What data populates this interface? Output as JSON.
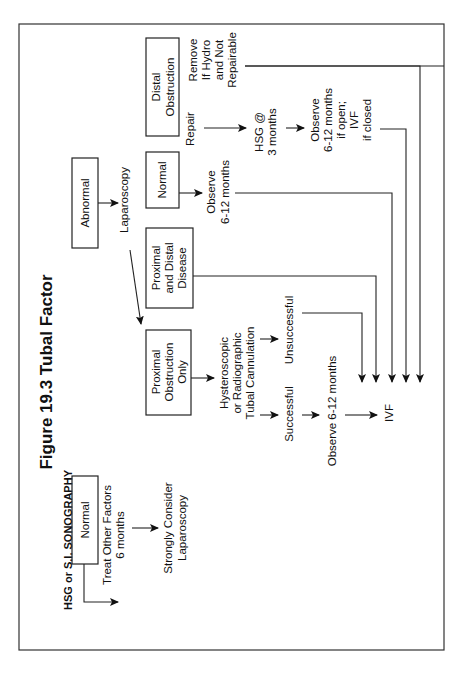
{
  "page_header": "A Clinician's Guide to Infertility",
  "figure": {
    "title": "Figure 19.3  Tubal Factor",
    "subtitle": "HSG or S.I. SONOGRAPHY"
  },
  "nodes": {
    "normal": "Normal",
    "treat_other": [
      "Treat Other Factors",
      "6 months"
    ],
    "strongly_consider": [
      "Strongly Consider",
      "Laparoscopy"
    ],
    "abnormal": "Abnormal",
    "laparoscopy": "Laparoscopy",
    "proximal_only": [
      "Proximal",
      "Obstruction",
      "Only"
    ],
    "proximal_distal": [
      "Proximal",
      "and Distal",
      "Disease"
    ],
    "lap_normal": "Normal",
    "distal_obstruction": [
      "Distal",
      "Obstruction"
    ],
    "cannulation": [
      "Hysteroscopic",
      "or Radiographic",
      "Tubal Cannulation"
    ],
    "successful": "Successful",
    "unsuccessful": "Unsuccessful",
    "observe_after_success": "Observe 6-12 months",
    "ivf": "IVF",
    "observe_normal": [
      "Observe",
      "6-12 months"
    ],
    "repair": "Repair",
    "remove": [
      "Remove",
      "If Hydro",
      "and Not",
      "Repairable"
    ],
    "hsg_3mo": [
      "HSG @",
      "3 months"
    ],
    "observe_open": [
      "Observe",
      "6-12 months",
      "if open;",
      "IVF",
      "if closed"
    ]
  }
}
